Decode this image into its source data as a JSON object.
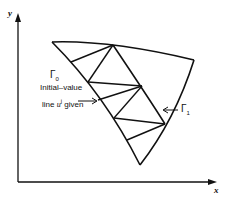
{
  "axes": {
    "x_label": "x",
    "y_label": "y"
  },
  "labels": {
    "gamma0": "Γ",
    "gamma0_sub": "0",
    "initial_line1": "Initial–value",
    "initial_line2_pre": "line ",
    "initial_line2_var": "u",
    "initial_line2_sup": "j",
    "initial_line2_post": " given",
    "gamma1": "Γ",
    "gamma1_sub": "1"
  },
  "colors": {
    "stroke": "#111111",
    "background": "#ffffff"
  }
}
